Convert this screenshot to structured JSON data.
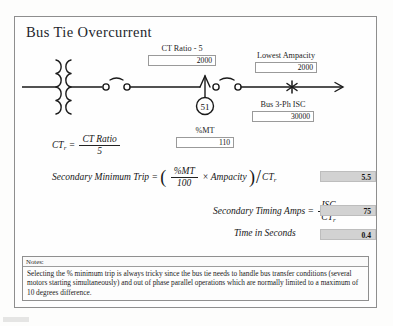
{
  "window": {
    "title": "Bus Tie Overcurrent"
  },
  "colors": {
    "frame_border": "#8e8e8e",
    "input_bg": "#ffffff",
    "result_bg": "#d2d2d2",
    "text": "#1d1d1d"
  },
  "fields": [
    {
      "name": "ct-ratio",
      "label": "CT Ratio - 5",
      "value": "2000"
    },
    {
      "name": "lowest-ampacity",
      "label": "Lowest Ampacity",
      "value": "2000"
    },
    {
      "name": "bus-3ph-isc",
      "label": "Bus 3-Ph ISC",
      "value": "30000"
    },
    {
      "name": "percent-mt",
      "label": "%MT",
      "value": "110"
    }
  ],
  "diagram": {
    "relay_label": "51",
    "transformer": "two-winding-transformer",
    "breakers": 2,
    "fault_marker": "3-phase-short-circuit-asterisk"
  },
  "equations": {
    "ctr": {
      "lhs": "CT",
      "lhs_sub": "r",
      "eq": "=",
      "num": "CT Ratio",
      "den": "5"
    },
    "secondary_minimum_trip": {
      "label": "Secondary Minimum Trip",
      "eq": "=",
      "num": "%MT",
      "den": "100",
      "times": "×",
      "factor": "Ampacity",
      "divider": "CT",
      "divider_sub": "r",
      "result": "5.5"
    },
    "secondary_timing_amps": {
      "label": "Secondary Timing Amps",
      "eq": "=",
      "num": "ISC",
      "den": "CT",
      "den_sub": "r",
      "result": "75"
    },
    "time_in_seconds": {
      "label": "Time in Seconds",
      "result": "0.4"
    }
  },
  "notes": {
    "header": "Notes:",
    "body": "Selecting the % minimum trip is always tricky since the bus tie needs to handle bus transfer conditions (several motors starting simultaneously) and out of phase parallel operations which are normally limited to a maximum of 10 degrees difference."
  }
}
